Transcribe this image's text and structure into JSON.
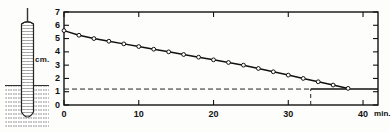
{
  "figure": {
    "unit_label": "cm.",
    "x_unit_label": "min."
  },
  "apparatus": {
    "name": "capillary-tube-in-liquid-bath",
    "parts": {
      "stem": "capillary-stem",
      "tube": "hatched-cylindrical-tube",
      "bath": "hatched-liquid-bath",
      "bath_surface": "liquid-surface-line"
    }
  },
  "chart_data": {
    "type": "line",
    "title": "",
    "xlabel": "min.",
    "ylabel": "cm.",
    "xlim": [
      0,
      42
    ],
    "ylim": [
      0,
      7
    ],
    "grid": false,
    "legend": null,
    "x_ticks": [
      0,
      10,
      20,
      30,
      40
    ],
    "x_tick_labels": [
      "0",
      "10",
      "20",
      "30",
      "40"
    ],
    "y_ticks": [
      0,
      1,
      2,
      3,
      4,
      5,
      6,
      7
    ],
    "y_tick_labels": [
      "0",
      "1",
      "2",
      "3",
      "4",
      "5",
      "6",
      "7"
    ],
    "series": [
      {
        "name": "height",
        "marker": "open-circle",
        "x": [
          0,
          2,
          4,
          6,
          8,
          10,
          12,
          14,
          16,
          18,
          20,
          22,
          24,
          26,
          28,
          30,
          32,
          34,
          36,
          38
        ],
        "values": [
          5.6,
          5.25,
          5.0,
          4.8,
          4.6,
          4.4,
          4.2,
          4.0,
          3.8,
          3.6,
          3.4,
          3.2,
          3.0,
          2.75,
          2.5,
          2.25,
          2.0,
          1.75,
          1.5,
          1.25
        ]
      }
    ],
    "annotations": [
      {
        "name": "asymptote",
        "type": "horizontal-dashed-line",
        "y": 1.2,
        "x_start": 0,
        "x_end": 33
      },
      {
        "name": "asymptote-solid",
        "type": "horizontal-solid-line",
        "y": 1.2,
        "x_start": 33,
        "x_end": 42
      },
      {
        "name": "equilibrium-marker",
        "type": "vertical-dashed-line",
        "x": 33,
        "y_start": 0,
        "y_end": 1.2
      }
    ]
  }
}
